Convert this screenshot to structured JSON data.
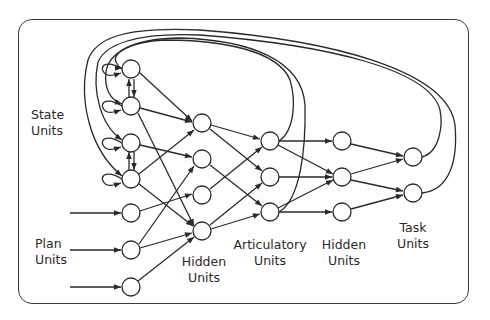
{
  "diagram": {
    "type": "recurrent-neural-network",
    "colors": {
      "stroke": "#2a2a2a",
      "node_fill": "#ffffff",
      "frame": "#3a3a3a",
      "background": "#ffffff"
    },
    "layers": {
      "state_units": {
        "label": "State\nUnits",
        "count": 4
      },
      "plan_units": {
        "label": "Plan\nUnits",
        "count": 3
      },
      "hidden_units_1": {
        "label": "Hidden\nUnits",
        "count": 4
      },
      "articulatory_units": {
        "label": "Articulatory\nUnits",
        "count": 3
      },
      "hidden_units_2": {
        "label": "Hidden\nUnits",
        "count": 3
      },
      "task_units": {
        "label": "Task\nUnits",
        "count": 2
      }
    }
  }
}
